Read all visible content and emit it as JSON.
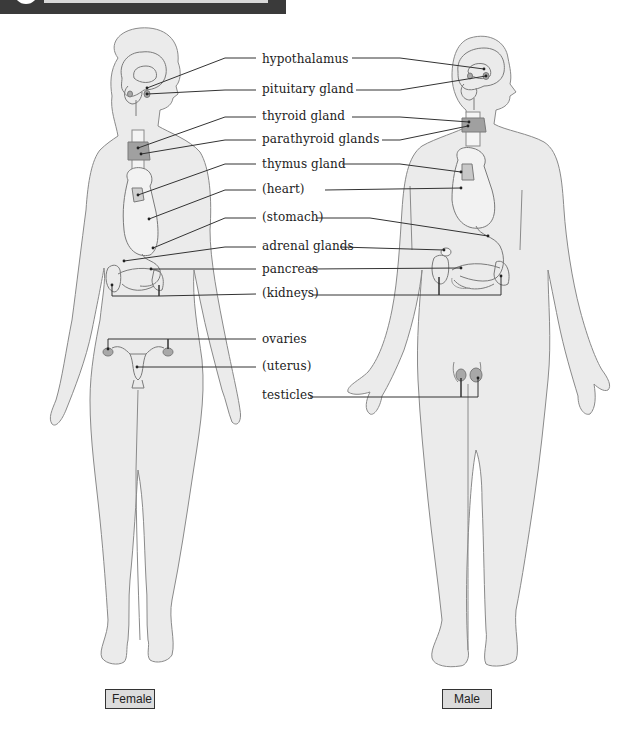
{
  "header": {
    "bar_color": "#3a3a3a",
    "rule_color": "#d8d8d8"
  },
  "colors": {
    "body_fill": "#ebebeb",
    "body_stroke": "#8a8a8a",
    "gland_fill": "#a8a8a8",
    "organ_stroke": "#6a6a6a",
    "leader_line": "#333333"
  },
  "labels": [
    {
      "id": "hypothalamus",
      "text": "hypothalamus",
      "x": 262,
      "y": 52
    },
    {
      "id": "pituitary",
      "text": "pituitary gland",
      "x": 262,
      "y": 82
    },
    {
      "id": "thyroid",
      "text": "thyroid gland",
      "x": 262,
      "y": 109
    },
    {
      "id": "parathyroid",
      "text": "parathyroid glands",
      "x": 262,
      "y": 132
    },
    {
      "id": "thymus",
      "text": "thymus gland",
      "x": 262,
      "y": 157
    },
    {
      "id": "heart",
      "text": "(heart)",
      "x": 262,
      "y": 182
    },
    {
      "id": "stomach",
      "text": "(stomach)",
      "x": 262,
      "y": 210
    },
    {
      "id": "adrenal",
      "text": "adrenal glands",
      "x": 262,
      "y": 239
    },
    {
      "id": "pancreas",
      "text": "pancreas",
      "x": 262,
      "y": 262
    },
    {
      "id": "kidneys",
      "text": "(kidneys)",
      "x": 262,
      "y": 286
    },
    {
      "id": "ovaries",
      "text": "ovaries",
      "x": 262,
      "y": 332
    },
    {
      "id": "uterus",
      "text": "(uterus)",
      "x": 262,
      "y": 359
    },
    {
      "id": "testicles",
      "text": "testicles",
      "x": 262,
      "y": 388
    }
  ],
  "captions": {
    "female": {
      "text": "Female",
      "x": 105,
      "y": 689,
      "w": 48
    },
    "male": {
      "text": "Male",
      "x": 442,
      "y": 689,
      "w": 48
    }
  },
  "leaders": {
    "female": [
      {
        "to": "hypothalamus",
        "pts": [
          [
            147,
            88
          ],
          [
            225,
            58
          ],
          [
            256,
            58
          ]
        ]
      },
      {
        "to": "pituitary",
        "pts": [
          [
            147,
            94
          ],
          [
            225,
            90
          ],
          [
            256,
            90
          ]
        ]
      },
      {
        "to": "thyroid",
        "pts": [
          [
            138,
            148
          ],
          [
            225,
            117
          ],
          [
            256,
            117
          ]
        ]
      },
      {
        "to": "parathyroid",
        "pts": [
          [
            141,
            154
          ],
          [
            225,
            140
          ],
          [
            256,
            140
          ]
        ]
      },
      {
        "to": "thymus",
        "pts": [
          [
            138,
            195
          ],
          [
            225,
            164
          ],
          [
            256,
            164
          ]
        ]
      },
      {
        "to": "heart",
        "pts": [
          [
            149,
            219
          ],
          [
            225,
            190
          ],
          [
            256,
            190
          ]
        ]
      },
      {
        "to": "stomach",
        "pts": [
          [
            153,
            248
          ],
          [
            225,
            218
          ],
          [
            256,
            218
          ]
        ]
      },
      {
        "to": "adrenal",
        "pts": [
          [
            124,
            261
          ],
          [
            225,
            247
          ],
          [
            256,
            247
          ]
        ]
      },
      {
        "to": "pancreas",
        "pts": [
          [
            151,
            269
          ],
          [
            256,
            269
          ]
        ]
      },
      {
        "to": "kidneys",
        "pts": [
          [
            112,
            285
          ],
          [
            112,
            296
          ],
          [
            159,
            296
          ],
          [
            159,
            285
          ],
          [
            159,
            296
          ],
          [
            256,
            294
          ]
        ]
      },
      {
        "to": "ovaries",
        "pts": [
          [
            108,
            349
          ],
          [
            108,
            339
          ],
          [
            168,
            339
          ],
          [
            168,
            349
          ],
          [
            168,
            339
          ],
          [
            256,
            339
          ]
        ]
      },
      {
        "to": "uterus",
        "pts": [
          [
            137,
            367
          ],
          [
            256,
            367
          ]
        ]
      }
    ],
    "male": [
      {
        "from": "hypothalamus",
        "pts": [
          [
            352,
            58
          ],
          [
            400,
            58
          ],
          [
            484,
            69
          ]
        ]
      },
      {
        "from": "pituitary",
        "pts": [
          [
            356,
            90
          ],
          [
            400,
            90
          ],
          [
            486,
            76
          ]
        ]
      },
      {
        "from": "thyroid",
        "pts": [
          [
            352,
            117
          ],
          [
            400,
            117
          ],
          [
            469,
            122
          ]
        ]
      },
      {
        "from": "parathyroid",
        "pts": [
          [
            382,
            140
          ],
          [
            400,
            140
          ],
          [
            468,
            126
          ]
        ]
      },
      {
        "from": "thymus",
        "pts": [
          [
            342,
            164
          ],
          [
            400,
            164
          ],
          [
            461,
            172
          ]
        ]
      },
      {
        "from": "heart",
        "pts": [
          [
            325,
            190
          ],
          [
            461,
            188
          ]
        ]
      },
      {
        "from": "stomach",
        "pts": [
          [
            317,
            218
          ],
          [
            370,
            218
          ],
          [
            488,
            236
          ]
        ]
      },
      {
        "from": "adrenal",
        "pts": [
          [
            340,
            247
          ],
          [
            444,
            250
          ]
        ]
      },
      {
        "from": "pancreas",
        "pts": [
          [
            310,
            269
          ],
          [
            461,
            268
          ]
        ]
      },
      {
        "from": "kidneys",
        "pts": [
          [
            313,
            295
          ],
          [
            439,
            295
          ],
          [
            439,
            277
          ],
          [
            439,
            295
          ],
          [
            501,
            295
          ],
          [
            501,
            276
          ]
        ]
      },
      {
        "from": "testicles",
        "pts": [
          [
            310,
            397
          ],
          [
            461,
            397
          ],
          [
            461,
            378
          ],
          [
            461,
            397
          ],
          [
            478,
            397
          ],
          [
            478,
            378
          ]
        ]
      }
    ]
  }
}
